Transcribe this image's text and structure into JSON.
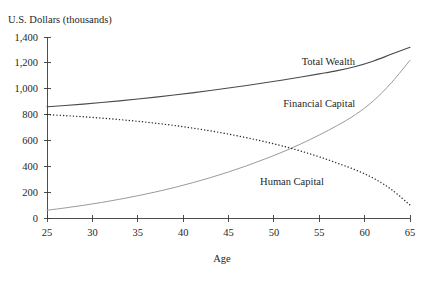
{
  "chart_data": {
    "type": "line",
    "title": "U.S. Dollars (thousands)",
    "subtitle": "",
    "xlabel": "Age",
    "ylabel": "U.S. Dollars (thousands)",
    "xlim": [
      25,
      65
    ],
    "ylim": [
      0,
      1400
    ],
    "grid": false,
    "legend_position": "inline-annotations",
    "x_ticks": [
      25,
      30,
      35,
      40,
      45,
      50,
      55,
      60,
      65
    ],
    "x_tick_labels": [
      "25",
      "30",
      "35",
      "40",
      "45",
      "50",
      "55",
      "60",
      "65"
    ],
    "y_ticks": [
      0,
      200,
      400,
      600,
      800,
      1000,
      1200,
      1400
    ],
    "y_tick_labels": [
      "0",
      "200",
      "400",
      "600",
      "800",
      "1,000",
      "1,200",
      "1,400"
    ],
    "x": [
      25,
      27,
      29,
      31,
      33,
      35,
      37,
      39,
      41,
      43,
      45,
      47,
      49,
      51,
      53,
      55,
      57,
      59,
      61,
      63,
      65
    ],
    "series": [
      {
        "name": "Total Wealth",
        "style": "solid",
        "color": "#4a4a4a",
        "width": 1.1,
        "label_x": 56,
        "label_y": 1180,
        "values": [
          860,
          870,
          881,
          893,
          906,
          920,
          935,
          951,
          968,
          986,
          1005,
          1025,
          1046,
          1068,
          1091,
          1115,
          1140,
          1172,
          1215,
          1268,
          1320
        ]
      },
      {
        "name": "Financial Capital",
        "style": "solid",
        "color": "#9a9a9a",
        "width": 1.0,
        "label_x": 55,
        "label_y": 855,
        "values": [
          60,
          78,
          98,
          120,
          145,
          172,
          202,
          235,
          272,
          312,
          356,
          404,
          456,
          512,
          574,
          642,
          716,
          800,
          908,
          1050,
          1220
        ]
      },
      {
        "name": "Human Capital",
        "style": "dotted",
        "color": "#2b2b2b",
        "width": 1.4,
        "label_x": 52,
        "label_y": 255,
        "values": [
          800,
          792,
          783,
          773,
          761,
          748,
          733,
          716,
          696,
          674,
          649,
          621,
          590,
          556,
          517,
          473,
          424,
          372,
          307,
          218,
          100
        ]
      }
    ],
    "annotations": [
      {
        "text": "Total Wealth",
        "x": 56,
        "y": 1180
      },
      {
        "text": "Financial Capital",
        "x": 55,
        "y": 855
      },
      {
        "text": "Human Capital",
        "x": 52,
        "y": 255
      }
    ]
  }
}
